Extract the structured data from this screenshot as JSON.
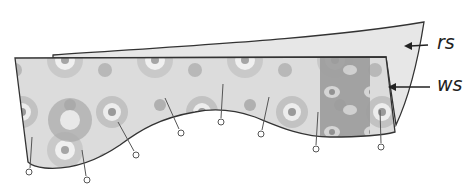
{
  "diagram": {
    "labels": {
      "rs": "rs",
      "ws": "ws"
    },
    "colors": {
      "outline": "#333333",
      "fabric_light": "#e4e4e4",
      "fabric_mid": "#b5b5b5",
      "fabric_dark": "#8a8a8a",
      "back_fabric": "#e9e9e9",
      "arrow": "#222222"
    },
    "pins": [
      {
        "x": 29,
        "y": 172
      },
      {
        "x": 87,
        "y": 180
      },
      {
        "x": 136,
        "y": 155
      },
      {
        "x": 181,
        "y": 133
      },
      {
        "x": 221,
        "y": 122
      },
      {
        "x": 261,
        "y": 134
      },
      {
        "x": 316,
        "y": 149
      },
      {
        "x": 381,
        "y": 147
      }
    ]
  }
}
